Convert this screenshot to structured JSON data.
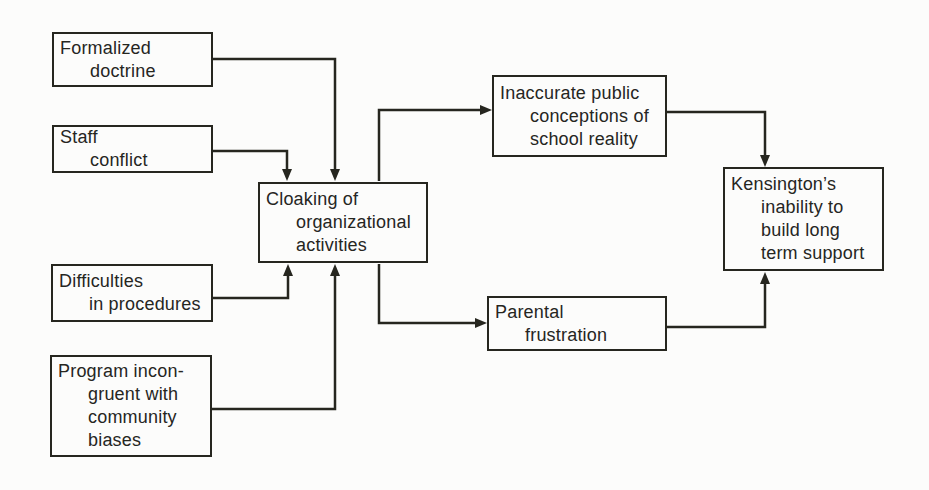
{
  "palette": {
    "background": "#fcfcfb",
    "ink": "#26261f"
  },
  "diagram_type": "flowchart",
  "nodes": {
    "formalized": {
      "lines": [
        "Formalized",
        "doctrine"
      ]
    },
    "staff": {
      "lines": [
        "Staff",
        "conflict"
      ]
    },
    "difficulties": {
      "lines": [
        "Difficulties",
        "in procedures"
      ]
    },
    "program": {
      "lines": [
        "Program incon-",
        "gruent with",
        "community",
        "biases"
      ]
    },
    "cloaking": {
      "lines": [
        "Cloaking of",
        "organizational",
        "activities"
      ]
    },
    "inaccurate": {
      "lines": [
        "Inaccurate public",
        "conceptions of",
        "school reality"
      ]
    },
    "parental": {
      "lines": [
        "Parental",
        "frustration"
      ]
    },
    "kensington": {
      "lines": [
        "Kensington’s",
        "inability to",
        "build long",
        "term support"
      ]
    }
  },
  "edges": [
    {
      "from": "formalized",
      "to": "cloaking"
    },
    {
      "from": "staff",
      "to": "cloaking"
    },
    {
      "from": "difficulties",
      "to": "cloaking"
    },
    {
      "from": "program",
      "to": "cloaking"
    },
    {
      "from": "cloaking",
      "to": "inaccurate"
    },
    {
      "from": "cloaking",
      "to": "parental"
    },
    {
      "from": "inaccurate",
      "to": "kensington"
    },
    {
      "from": "parental",
      "to": "kensington"
    }
  ]
}
